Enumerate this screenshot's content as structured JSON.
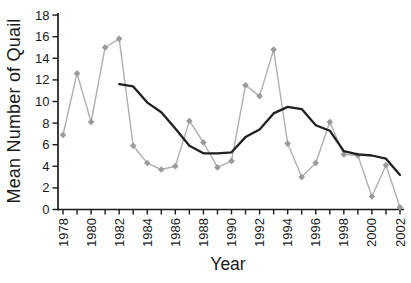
{
  "chart_data": {
    "type": "line",
    "title": "",
    "xlabel": "Year",
    "ylabel": "Mean Number of Quail",
    "x": [
      1978,
      1979,
      1980,
      1981,
      1982,
      1983,
      1984,
      1985,
      1986,
      1987,
      1988,
      1989,
      1990,
      1991,
      1992,
      1993,
      1994,
      1995,
      1996,
      1997,
      1998,
      1999,
      2000,
      2001,
      2002
    ],
    "x_label_every": 2,
    "ylim": [
      0,
      18
    ],
    "y_tick_step": 2,
    "grid": false,
    "legend_position": "none",
    "axis_color": "#1a1a1a",
    "tick_label_color": "#1a1a1a",
    "series": [
      {
        "name": "annual-mean-quail",
        "color": "#afafaf",
        "marker": "diamond",
        "marker_color": "#9a9a9a",
        "line_width": 1.4,
        "values": [
          6.9,
          12.6,
          8.1,
          15.0,
          15.8,
          5.9,
          4.3,
          3.7,
          4.0,
          8.2,
          6.2,
          3.9,
          4.5,
          11.5,
          10.5,
          14.8,
          6.1,
          3.0,
          4.3,
          8.1,
          5.1,
          5.0,
          1.2,
          4.1,
          0.2
        ]
      },
      {
        "name": "smoothed-trend",
        "color": "#202020",
        "marker": "none",
        "marker_color": "",
        "line_width": 2.3,
        "values": [
          null,
          null,
          null,
          null,
          11.6,
          11.4,
          9.9,
          9.0,
          7.5,
          5.9,
          5.2,
          5.2,
          5.3,
          6.7,
          7.4,
          8.9,
          9.5,
          9.3,
          7.8,
          7.3,
          5.4,
          5.1,
          5.0,
          4.7,
          3.2
        ]
      }
    ]
  }
}
